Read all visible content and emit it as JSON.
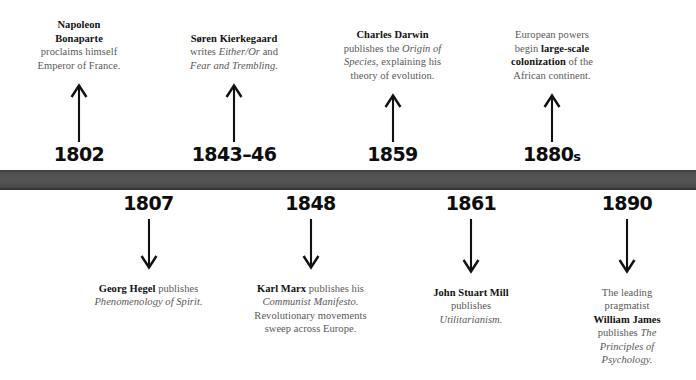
{
  "diagram": {
    "type": "timeline",
    "bar_color": "#4f4f4f",
    "background_color": "#ffffff",
    "text_color": "#585858",
    "emphasis_color": "#111111",
    "year_color": "#0d0d0d"
  },
  "events_above": [
    {
      "year": "1802",
      "year_suffix": "",
      "arrow": "arrow-up-icon",
      "text_html": "<b>Napoleon<br>Bonaparte</b><br>proclaims himself<br>Emperor of France.",
      "text_plain": "Napoleon Bonaparte proclaims himself Emperor of France."
    },
    {
      "year": "1843–46",
      "year_suffix": "",
      "arrow": "arrow-up-icon",
      "text_html": "<b>Søren Kierkegaard</b><br>writes <i>Either/Or</i> and<br><i>Fear and Trembling.</i>",
      "text_plain": "Søren Kierkegaard writes Either/Or and Fear and Trembling."
    },
    {
      "year": "1859",
      "year_suffix": "",
      "arrow": "arrow-up-icon",
      "text_html": "<b>Charles Darwin</b><br>publishes the <i>Origin of<br>Species</i>, explaining his<br>theory of evolution.",
      "text_plain": "Charles Darwin publishes the Origin of Species, explaining his theory of evolution."
    },
    {
      "year": "1880",
      "year_suffix": "s",
      "arrow": "arrow-up-icon",
      "text_html": "European powers<br>begin <b>large-scale<br>colonization</b> of the<br>African continent.",
      "text_plain": "European powers begin large-scale colonization of the African continent."
    }
  ],
  "events_below": [
    {
      "year": "1807",
      "year_suffix": "",
      "arrow": "arrow-down-icon",
      "text_html": "<b>Georg Hegel</b> publishes<br><i>Phenomenology of Spirit.</i>",
      "text_plain": "Georg Hegel publishes Phenomenology of Spirit."
    },
    {
      "year": "1848",
      "year_suffix": "",
      "arrow": "arrow-down-icon",
      "text_html": "<b>Karl Marx</b> publishes his<br><i>Communist Manifesto.</i><br>Revolutionary movements<br>sweep across Europe.",
      "text_plain": "Karl Marx publishes his Communist Manifesto. Revolutionary movements sweep across Europe."
    },
    {
      "year": "1861",
      "year_suffix": "",
      "arrow": "arrow-down-icon",
      "text_html": "<b>John Stuart Mill</b><br>publishes<br><i>Utilitarianism.</i>",
      "text_plain": "John Stuart Mill publishes Utilitarianism."
    },
    {
      "year": "1890",
      "year_suffix": "",
      "arrow": "arrow-down-icon",
      "text_html": "The leading<br>pragmatist<br><b>William James</b><br>publishes <i>The<br>Principles of<br>Psychology.</i>",
      "text_plain": "The leading pragmatist William James publishes The Principles of Psychology."
    }
  ]
}
